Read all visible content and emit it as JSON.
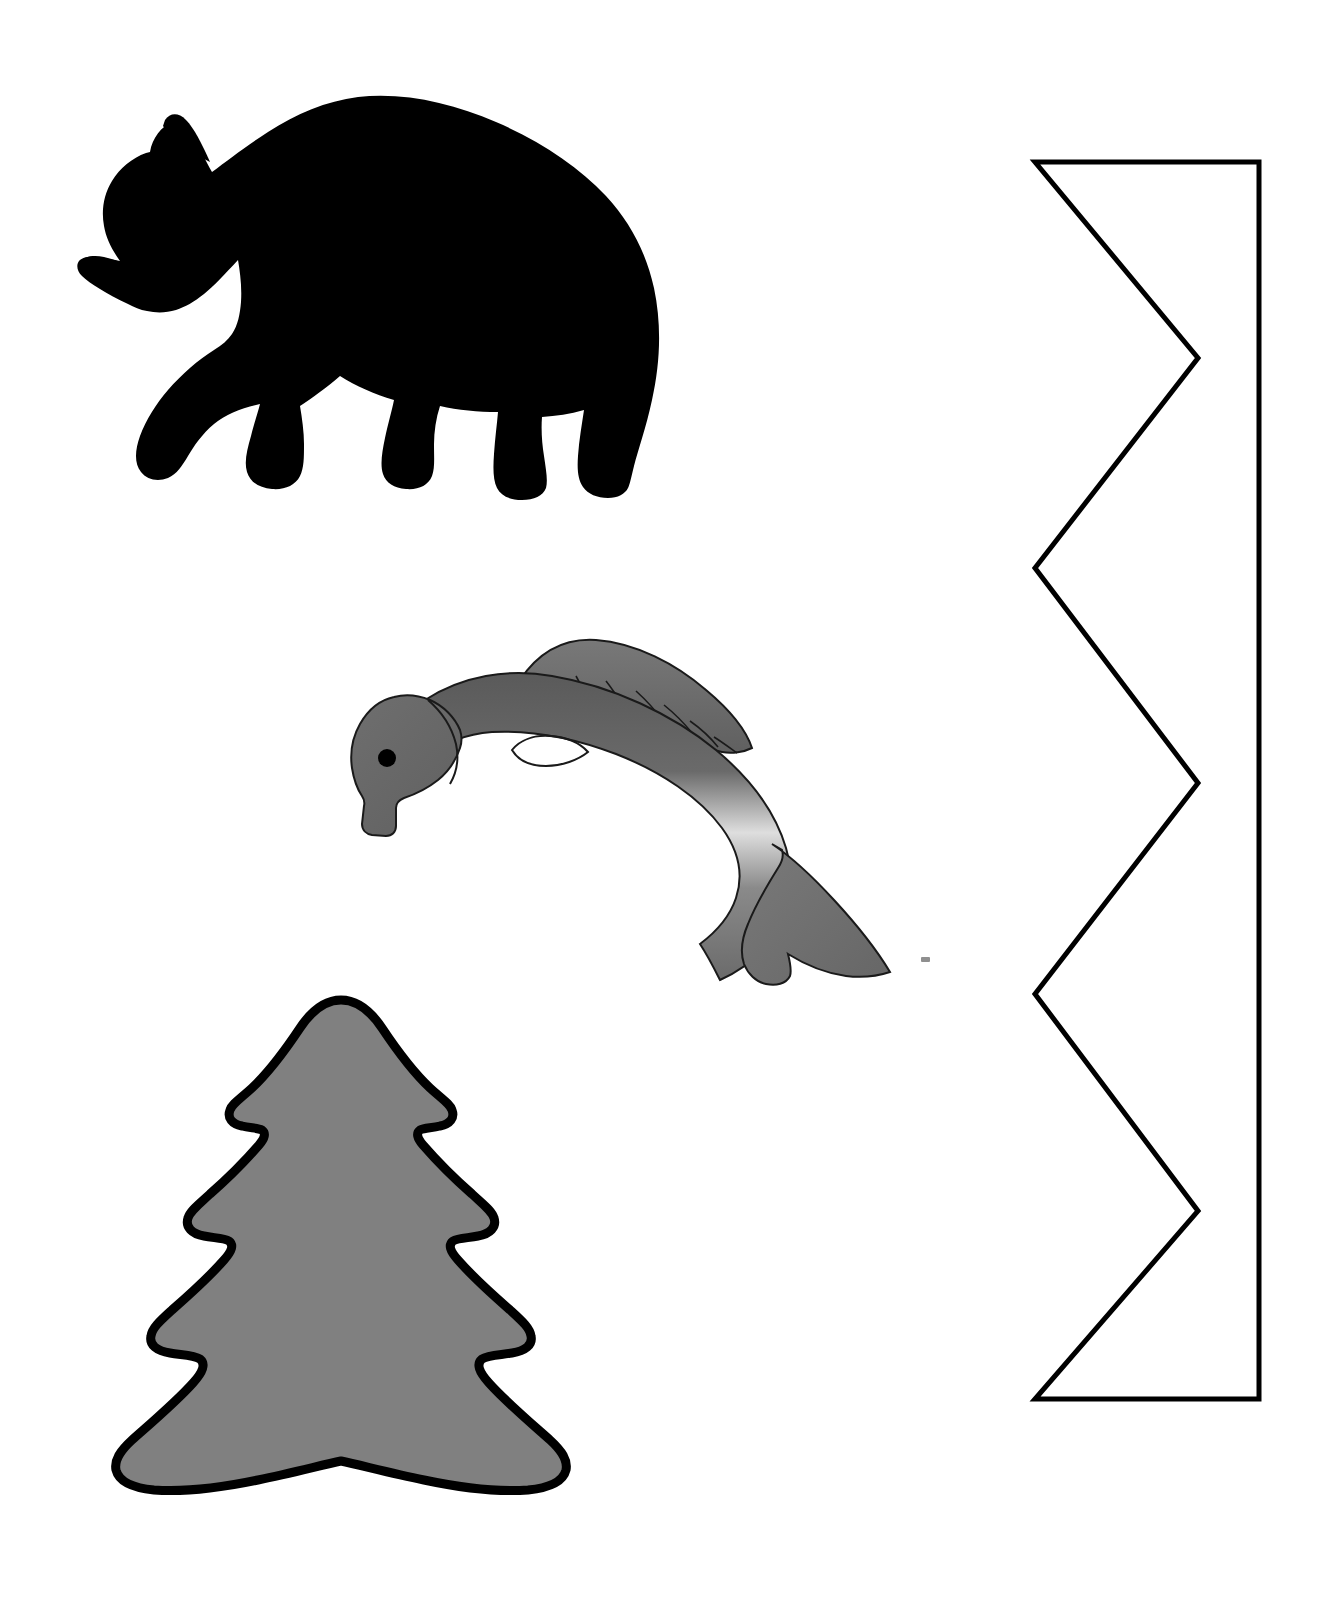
{
  "page": {
    "background_color": "#ffffff",
    "width": 1326,
    "height": 1622
  },
  "shapes": [
    {
      "id": "bear",
      "name": "bear-silhouette",
      "label": "Bear",
      "fill_color": "#000000",
      "stroke_color": "#000000",
      "stroke_width": 0,
      "bbox": {
        "x": 78,
        "y": 96,
        "width": 590,
        "height": 404
      }
    },
    {
      "id": "fish",
      "name": "fish-illustration",
      "label": "Fish",
      "fill_color": "#6e6e6e",
      "highlight_color": "#e8e8e8",
      "dark_color": "#4f4f4f",
      "stroke_color": "#1a1a1a",
      "stroke_width": 2,
      "eye_color": "#000000",
      "bbox": {
        "x": 352,
        "y": 636,
        "width": 552,
        "height": 350
      }
    },
    {
      "id": "tree",
      "name": "fir-tree-shape",
      "label": "Fir tree",
      "fill_color": "#808080",
      "stroke_color": "#000000",
      "stroke_width": 9,
      "tiers": 4,
      "bbox": {
        "x": 116,
        "y": 994,
        "width": 450,
        "height": 520
      }
    },
    {
      "id": "zigzag",
      "name": "zigzag-strip-outline",
      "label": "Zigzag strip",
      "fill_color": "#ffffff",
      "stroke_color": "#000000",
      "stroke_width": 5,
      "points": [
        [
          1035,
          162
        ],
        [
          1259,
          162
        ],
        [
          1259,
          1399
        ],
        [
          1035,
          1399
        ],
        [
          1198,
          1211
        ],
        [
          1035,
          994
        ],
        [
          1198,
          783
        ],
        [
          1035,
          568
        ],
        [
          1198,
          358
        ]
      ],
      "bbox": {
        "x": 1035,
        "y": 162,
        "width": 224,
        "height": 1237
      }
    },
    {
      "id": "speck",
      "name": "stray-gray-speck",
      "label": "",
      "fill_color": "#8f8f8f",
      "bbox": {
        "x": 921,
        "y": 957,
        "width": 9,
        "height": 5
      }
    }
  ]
}
